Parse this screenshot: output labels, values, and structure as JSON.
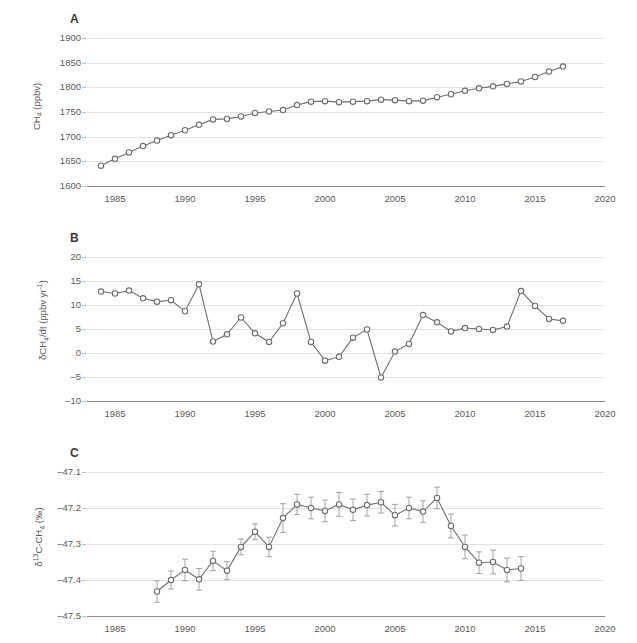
{
  "figure": {
    "panel_letters": [
      "A",
      "B",
      "C"
    ]
  },
  "chart_data": [
    {
      "type": "line",
      "panel": "A",
      "title": "",
      "xlabel": "",
      "ylabel": "CH4 (ppbv)",
      "ylabel_html": "CH<sub>4</sub> (ppbv)",
      "xlim": [
        1983,
        2020
      ],
      "ylim": [
        1600,
        1900
      ],
      "yticks": [
        1600,
        1650,
        1700,
        1750,
        1800,
        1850,
        1900
      ],
      "ytick_labels": [
        "1600",
        "1650",
        "1700",
        "1750",
        "1800",
        "1850",
        "1900"
      ],
      "xticks": [
        1985,
        1990,
        1995,
        2000,
        2005,
        2010,
        2015,
        2020
      ],
      "xtick_labels": [
        "1985",
        "1990",
        "1995",
        "2000",
        "2005",
        "2010",
        "2015",
        "2020"
      ],
      "grid": true,
      "legend": "none",
      "marker": "open-circle",
      "x": [
        1984,
        1985,
        1986,
        1987,
        1988,
        1989,
        1990,
        1991,
        1992,
        1993,
        1994,
        1995,
        1996,
        1997,
        1998,
        1999,
        2000,
        2001,
        2002,
        2003,
        2004,
        2005,
        2006,
        2007,
        2008,
        2009,
        2010,
        2011,
        2012,
        2013,
        2014,
        2015,
        2016,
        2017
      ],
      "values": [
        1641,
        1655,
        1668,
        1681,
        1692,
        1703,
        1713,
        1724,
        1735,
        1736,
        1741,
        1748,
        1751,
        1754,
        1764,
        1771,
        1772,
        1770,
        1771,
        1772,
        1775,
        1774,
        1772,
        1773,
        1780,
        1786,
        1793,
        1798,
        1802,
        1807,
        1812,
        1821,
        1832,
        1842
      ]
    },
    {
      "type": "line",
      "panel": "B",
      "title": "",
      "xlabel": "",
      "ylabel": "dCH4/dt (ppbv yr-1)",
      "ylabel_html": "&delta;CH<sub>4</sub>/dt (ppbv yr<sup>-1</sup>)",
      "xlim": [
        1983,
        2020
      ],
      "ylim": [
        -10,
        20
      ],
      "yticks": [
        -10,
        -5,
        0,
        5,
        10,
        15,
        20
      ],
      "ytick_labels": [
        "–10",
        "–5",
        "0",
        "5",
        "10",
        "15",
        "20"
      ],
      "xticks": [
        1985,
        1990,
        1995,
        2000,
        2005,
        2010,
        2015,
        2020
      ],
      "xtick_labels": [
        "1985",
        "1990",
        "1995",
        "2000",
        "2005",
        "2010",
        "2015",
        "2020"
      ],
      "grid": true,
      "legend": "none",
      "marker": "open-circle",
      "x": [
        1984,
        1985,
        1986,
        1987,
        1988,
        1989,
        1990,
        1991,
        1992,
        1993,
        1994,
        1995,
        1996,
        1997,
        1998,
        1999,
        2000,
        2001,
        2002,
        2003,
        2004,
        2005,
        2006,
        2007,
        2008,
        2009,
        2010,
        2011,
        2012,
        2013,
        2014,
        2015,
        2016,
        2017
      ],
      "values": [
        12.8,
        12.4,
        13.0,
        11.4,
        10.7,
        11.0,
        8.7,
        14.3,
        2.4,
        3.9,
        7.4,
        4.1,
        2.3,
        6.2,
        12.4,
        2.3,
        -1.6,
        -0.8,
        3.2,
        4.9,
        -5.1,
        0.3,
        1.9,
        7.9,
        6.4,
        4.5,
        5.2,
        5.0,
        4.8,
        5.5,
        12.9,
        9.8,
        7.1,
        6.7
      ]
    },
    {
      "type": "line",
      "panel": "C",
      "title": "",
      "xlabel": "",
      "ylabel": "d13C-CH4 (permil)",
      "ylabel_html": "&delta;<sup>13</sup>C-CH<sub>4</sub> (&permil;)",
      "xlim": [
        1983,
        2020
      ],
      "ylim": [
        -47.5,
        -47.1
      ],
      "yticks": [
        -47.5,
        -47.4,
        -47.3,
        -47.2,
        -47.1
      ],
      "ytick_labels": [
        "–47.5",
        "–47.4",
        "–47.3",
        "–47.2",
        "–47.1"
      ],
      "xticks": [
        1985,
        1990,
        1995,
        2000,
        2005,
        2010,
        2015,
        2020
      ],
      "xtick_labels": [
        "1985",
        "1990",
        "1995",
        "2000",
        "2005",
        "2010",
        "2015",
        "2020"
      ],
      "grid": true,
      "legend": "none",
      "marker": "open-circle",
      "error_bars": true,
      "x": [
        1988,
        1989,
        1990,
        1991,
        1992,
        1993,
        1994,
        1995,
        1996,
        1997,
        1998,
        1999,
        2000,
        2001,
        2002,
        2003,
        2004,
        2005,
        2006,
        2007,
        2008,
        2009,
        2010,
        2011,
        2012,
        2013,
        2014
      ],
      "values": [
        -47.432,
        -47.4,
        -47.372,
        -47.398,
        -47.347,
        -47.374,
        -47.308,
        -47.266,
        -47.308,
        -47.228,
        -47.19,
        -47.2,
        -47.208,
        -47.19,
        -47.205,
        -47.192,
        -47.184,
        -47.22,
        -47.2,
        -47.21,
        -47.172,
        -47.25,
        -47.308,
        -47.352,
        -47.35,
        -47.372,
        -47.368
      ],
      "errors": [
        0.03,
        0.025,
        0.03,
        0.03,
        0.027,
        0.025,
        0.022,
        0.022,
        0.027,
        0.04,
        0.028,
        0.03,
        0.03,
        0.033,
        0.03,
        0.03,
        0.03,
        0.03,
        0.03,
        0.03,
        0.03,
        0.033,
        0.033,
        0.03,
        0.033,
        0.033,
        0.033
      ]
    }
  ]
}
